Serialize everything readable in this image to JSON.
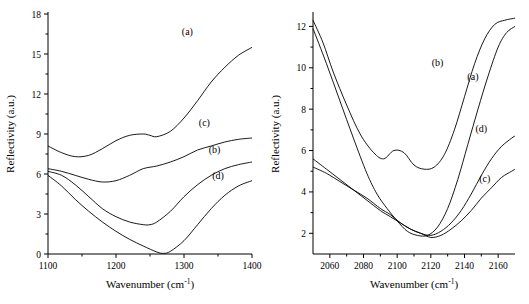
{
  "figure": {
    "background": "#ffffff",
    "line_color": "#000000"
  },
  "chart_data": [
    {
      "type": "line",
      "panel": "left",
      "title": "",
      "xlabel": "Wavenumber (cm-1)",
      "xlabel_base": "Wavenumber (cm",
      "xlabel_sup": "-1",
      "xlabel_tail": ")",
      "ylabel": "Reflectivity (a.u.)",
      "xlim": [
        1100,
        1400
      ],
      "ylim": [
        0,
        18
      ],
      "xticks": [
        1100,
        1200,
        1300,
        1400
      ],
      "yticks": [
        0,
        3,
        6,
        9,
        12,
        15,
        18
      ],
      "grid": false,
      "legend": "inline-labels",
      "series": [
        {
          "name": "(a)",
          "label": "(a)",
          "label_x": 1305,
          "label_y": 16.4,
          "x": [
            1100,
            1120,
            1140,
            1160,
            1180,
            1200,
            1220,
            1240,
            1250,
            1260,
            1280,
            1300,
            1320,
            1340,
            1360,
            1380,
            1400
          ],
          "y": [
            8.1,
            7.6,
            7.3,
            7.4,
            7.9,
            8.5,
            8.9,
            9.0,
            8.9,
            8.8,
            9.2,
            10.2,
            11.5,
            12.9,
            14.0,
            14.9,
            15.5
          ]
        },
        {
          "name": "(c)",
          "label": "(c)",
          "label_x": 1330,
          "label_y": 9.6,
          "x": [
            1100,
            1120,
            1140,
            1160,
            1180,
            1200,
            1220,
            1240,
            1260,
            1280,
            1300,
            1320,
            1340,
            1360,
            1380,
            1400
          ],
          "y": [
            6.4,
            6.2,
            5.9,
            5.6,
            5.4,
            5.5,
            5.9,
            6.4,
            6.6,
            6.9,
            7.3,
            7.8,
            8.1,
            8.4,
            8.6,
            8.7
          ]
        },
        {
          "name": "(b)",
          "label": "(b)",
          "label_x": 1345,
          "label_y": 7.6,
          "x": [
            1100,
            1120,
            1140,
            1160,
            1180,
            1200,
            1220,
            1240,
            1250,
            1260,
            1280,
            1300,
            1320,
            1340,
            1360,
            1380,
            1400
          ],
          "y": [
            6.2,
            5.9,
            5.2,
            4.3,
            3.4,
            2.8,
            2.4,
            2.2,
            2.2,
            2.4,
            3.2,
            4.3,
            5.2,
            5.9,
            6.4,
            6.7,
            6.9
          ]
        },
        {
          "name": "(d)",
          "label": "(d)",
          "label_x": 1350,
          "label_y": 5.6,
          "x": [
            1100,
            1120,
            1140,
            1160,
            1180,
            1200,
            1220,
            1240,
            1260,
            1270,
            1280,
            1300,
            1320,
            1340,
            1360,
            1380,
            1400
          ],
          "y": [
            5.9,
            5.1,
            4.1,
            3.2,
            2.4,
            1.7,
            1.1,
            0.6,
            0.15,
            0.05,
            0.2,
            1.0,
            2.2,
            3.4,
            4.4,
            5.1,
            5.5
          ]
        }
      ]
    },
    {
      "type": "line",
      "panel": "right",
      "title": "",
      "xlabel": "Wavenumber (cm-1)",
      "xlabel_base": "Wavenumber (cm",
      "xlabel_sup": "-1",
      "xlabel_tail": ")",
      "ylabel": "Reflectivity (a.u.)",
      "xlim": [
        2050,
        2170
      ],
      "ylim": [
        1,
        12.6
      ],
      "xticks": [
        2060,
        2080,
        2100,
        2120,
        2140,
        2160
      ],
      "yticks": [
        2,
        4,
        6,
        8,
        10,
        12
      ],
      "grid": false,
      "legend": "inline-labels",
      "series": [
        {
          "name": "(b)",
          "label": "(b)",
          "label_x": 2124,
          "label_y": 10.1,
          "x": [
            2050,
            2056,
            2062,
            2070,
            2078,
            2086,
            2092,
            2098,
            2104,
            2110,
            2116,
            2122,
            2128,
            2134,
            2140,
            2146,
            2152,
            2158,
            2164,
            2170
          ],
          "y": [
            12.3,
            11.2,
            9.8,
            8.2,
            6.8,
            5.9,
            5.6,
            6.0,
            5.9,
            5.3,
            5.1,
            5.2,
            5.8,
            7.0,
            8.6,
            10.2,
            11.4,
            12.1,
            12.3,
            12.4
          ]
        },
        {
          "name": "(a)",
          "label": "(a)",
          "label_x": 2145,
          "label_y": 9.4,
          "x": [
            2050,
            2058,
            2066,
            2074,
            2082,
            2088,
            2094,
            2100,
            2106,
            2112,
            2118,
            2124,
            2130,
            2136,
            2142,
            2148,
            2154,
            2160,
            2165,
            2170
          ],
          "y": [
            11.9,
            10.2,
            8.4,
            6.6,
            4.9,
            3.9,
            3.2,
            2.6,
            2.1,
            1.9,
            1.9,
            2.3,
            3.2,
            4.6,
            6.3,
            8.0,
            9.6,
            11.0,
            11.7,
            12.0
          ]
        },
        {
          "name": "(d)",
          "label": "(d)",
          "label_x": 2150,
          "label_y": 6.9,
          "x": [
            2050,
            2058,
            2066,
            2074,
            2082,
            2090,
            2096,
            2102,
            2108,
            2114,
            2120,
            2126,
            2132,
            2138,
            2144,
            2150,
            2156,
            2162,
            2168,
            2170
          ],
          "y": [
            5.6,
            5.1,
            4.6,
            4.1,
            3.6,
            3.1,
            2.8,
            2.5,
            2.2,
            2.0,
            1.9,
            2.1,
            2.5,
            3.1,
            3.9,
            4.8,
            5.6,
            6.2,
            6.6,
            6.7
          ]
        },
        {
          "name": "(c)",
          "label": "(c)",
          "label_x": 2152,
          "label_y": 4.5,
          "x": [
            2050,
            2058,
            2066,
            2074,
            2082,
            2090,
            2096,
            2102,
            2108,
            2114,
            2120,
            2126,
            2132,
            2138,
            2144,
            2150,
            2156,
            2162,
            2168,
            2170
          ],
          "y": [
            5.2,
            4.9,
            4.5,
            4.1,
            3.7,
            3.2,
            2.9,
            2.5,
            2.2,
            2.0,
            1.8,
            1.9,
            2.2,
            2.6,
            3.1,
            3.7,
            4.2,
            4.7,
            5.0,
            5.1
          ]
        }
      ]
    }
  ]
}
